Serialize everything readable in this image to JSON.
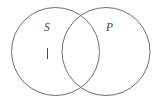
{
  "figure": {
    "type": "venn-diagram",
    "background_color": "#ffffff",
    "stroke_color": "#6e6e6e",
    "label_color": "#3f3f3f",
    "mark_color": "#4a4a4a",
    "circles": [
      {
        "id": "circle-s",
        "label": "S",
        "cx": 55.5,
        "cy": 51.5,
        "r": 44
      },
      {
        "id": "circle-p",
        "label": "P",
        "cx": 106,
        "cy": 51.5,
        "r": 44
      }
    ],
    "labels": {
      "left_circle": "S",
      "right_circle": "P"
    },
    "marks": [
      {
        "id": "mark-individual",
        "glyph": "|",
        "region": "S-only",
        "x": 47,
        "y": 48,
        "length": 11
      }
    ]
  }
}
